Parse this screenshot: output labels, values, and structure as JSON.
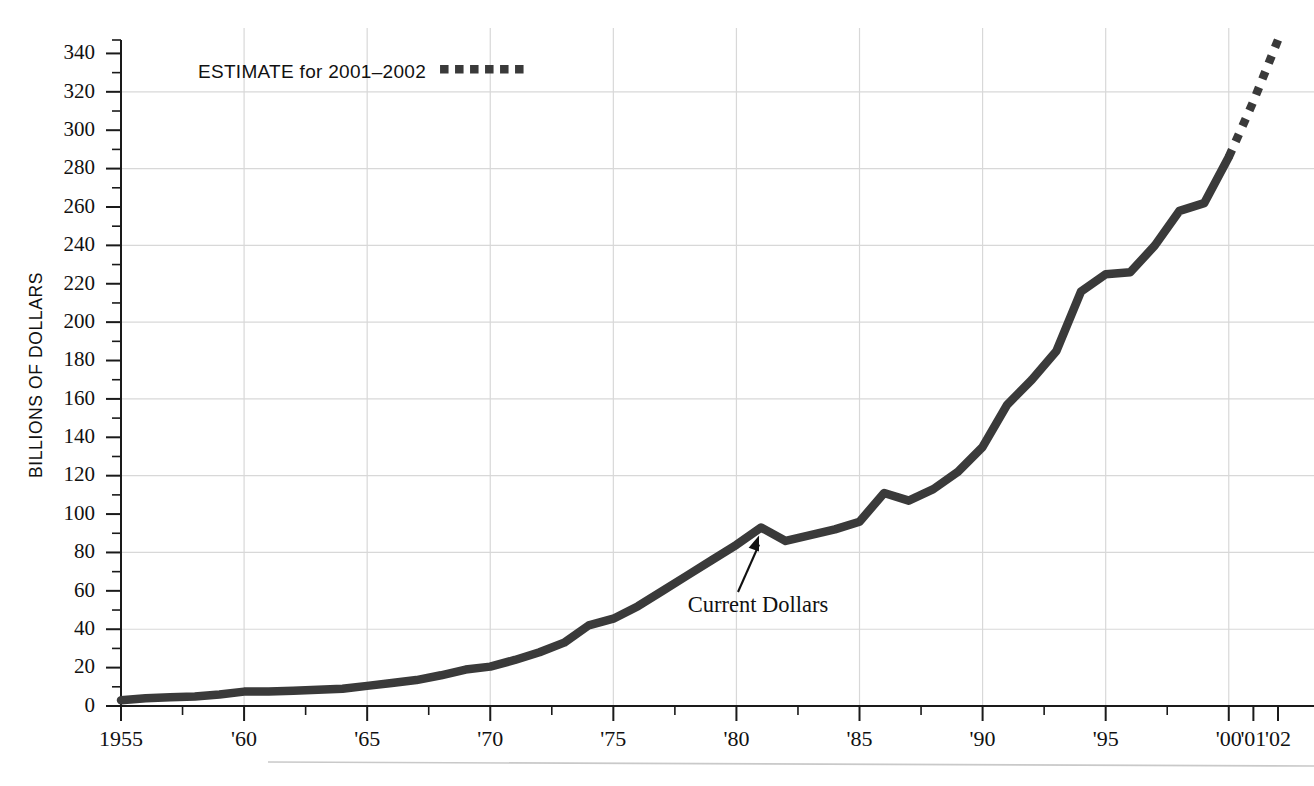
{
  "chart_data": {
    "type": "line",
    "title": "",
    "xlabel": "",
    "ylabel": "BILLIONS OF DOLLARS",
    "xlim": [
      1955,
      2002
    ],
    "ylim": [
      0,
      347
    ],
    "grid": "both-axes-light",
    "legend_position": "top-left-inside",
    "y_ticks_major": [
      0,
      20,
      40,
      60,
      80,
      100,
      120,
      140,
      160,
      180,
      200,
      220,
      240,
      260,
      280,
      300,
      320,
      340
    ],
    "y_tick_labels": [
      "0",
      "20",
      "40",
      "60",
      "80",
      "100",
      "120",
      "140",
      "160",
      "180",
      "200",
      "220",
      "240",
      "260",
      "280",
      "300",
      "320",
      "340"
    ],
    "y_minor_tick_step": 10,
    "y_gridline_values": [
      40,
      80,
      120,
      160,
      200,
      240,
      280,
      320
    ],
    "x_ticks_major": [
      1955,
      1960,
      1965,
      1970,
      1975,
      1980,
      1985,
      1990,
      1995,
      2000,
      2001,
      2002
    ],
    "x_tick_labels": [
      "1955",
      "'60",
      "'65",
      "'70",
      "'75",
      "'80",
      "'85",
      "'90",
      "'95",
      "'00",
      "'01",
      "'02"
    ],
    "x_gridline_values": [
      1960,
      1965,
      1970,
      1975,
      1980,
      1985,
      1990,
      1995,
      2000
    ],
    "legend": [
      {
        "label": "ESTIMATE for 2001–2002",
        "style": "dotted",
        "color": "#3a3a3a"
      }
    ],
    "annotations": [
      {
        "text": "Current Dollars",
        "points_to_year": 1981,
        "points_to_value": 93
      }
    ],
    "series": [
      {
        "name": "Current Dollars",
        "style": "solid",
        "color": "#3a3a3a",
        "x": [
          1955,
          1956,
          1957,
          1958,
          1959,
          1960,
          1961,
          1962,
          1963,
          1964,
          1965,
          1966,
          1967,
          1968,
          1969,
          1970,
          1971,
          1972,
          1973,
          1974,
          1975,
          1976,
          1977,
          1978,
          1979,
          1980,
          1981,
          1982,
          1983,
          1984,
          1985,
          1986,
          1987,
          1988,
          1989,
          1990,
          1991,
          1992,
          1993,
          1994,
          1995,
          1996,
          1997,
          1998,
          1999,
          2000
        ],
        "values": [
          3,
          4,
          4.5,
          5,
          6,
          7.5,
          7.5,
          8,
          8.5,
          9,
          10.5,
          12,
          13.5,
          16,
          19,
          20.5,
          24,
          28,
          33,
          42,
          45.5,
          52,
          60,
          68,
          76,
          84,
          93,
          86,
          89,
          92,
          96,
          111,
          107,
          113,
          122,
          135,
          157,
          170,
          185,
          216,
          225,
          226,
          240,
          258,
          262,
          286
        ]
      },
      {
        "name": "ESTIMATE for 2001–2002",
        "style": "dotted",
        "color": "#3a3a3a",
        "x": [
          2000,
          2001,
          2002
        ],
        "values": [
          286,
          315,
          347
        ]
      }
    ]
  },
  "footer": {
    "rule": true
  }
}
